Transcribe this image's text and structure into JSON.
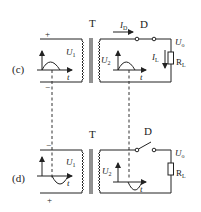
{
  "diagram": {
    "colors": {
      "line": "#222222",
      "background": "#ffffff"
    },
    "panels": [
      {
        "id": "c",
        "label": "(c)",
        "transformer_label": "T",
        "diode_label": "D",
        "diode_state": "closed",
        "primary_polarity_top": "+",
        "primary_polarity_bottom": "−",
        "primary_voltage": "U",
        "primary_voltage_sub": "1",
        "secondary_voltage": "U",
        "secondary_voltage_sub": "2",
        "time_axis": "t",
        "time_axis_secondary": "t",
        "diode_current": "I",
        "diode_current_sub": "D",
        "load_current": "I",
        "load_current_sub": "L",
        "output_voltage": "U",
        "output_voltage_sub": "o",
        "load_resistor": "R",
        "load_resistor_sub": "L",
        "waveform": "positive half-cycle"
      },
      {
        "id": "d",
        "label": "(d)",
        "transformer_label": "T",
        "diode_label": "D",
        "diode_state": "open",
        "primary_polarity_top": "−",
        "primary_polarity_bottom": "+",
        "primary_voltage": "U",
        "primary_voltage_sub": "1",
        "secondary_voltage": "U",
        "secondary_voltage_sub": "2",
        "time_axis": "t",
        "time_axis_secondary": "t",
        "output_voltage": "U",
        "output_voltage_sub": "o",
        "load_resistor": "R",
        "load_resistor_sub": "L",
        "waveform": "negative half-cycle"
      }
    ]
  }
}
